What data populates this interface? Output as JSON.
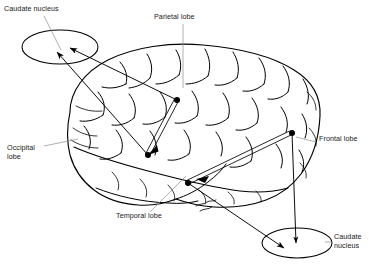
{
  "figure": {
    "background_color": "#ffffff",
    "ink_color": "#000000",
    "leader_color": "#8d8d8d",
    "width": 369,
    "height": 273
  },
  "labels": {
    "caudate_nucleus_top": "Caudate nucleus",
    "parietal_lobe": "Parietal lobe",
    "frontal_lobe": "Frontal lobe",
    "occipital_lobe_line1": "Occipital",
    "occipital_lobe_line2": "lobe",
    "temporal_lobe": "Temporal lobe",
    "caudate_nucleus_bottom_line1": "Caudate",
    "caudate_nucleus_bottom_line2": "nucleus"
  },
  "structures": {
    "ellipses": [
      {
        "name": "caudate-nucleus-upper-left",
        "center_x": 60,
        "center_y": 47,
        "radius_x": 38,
        "radius_y": 17,
        "incoming_arrows": 2
      },
      {
        "name": "caudate-nucleus-lower-right",
        "center_x": 297,
        "center_y": 243,
        "radius_x": 35,
        "radius_y": 15,
        "incoming_arrows": 2
      }
    ],
    "cortical_nodes": [
      {
        "name": "parietal-node",
        "x": 177,
        "y": 100
      },
      {
        "name": "occipital-node",
        "x": 148,
        "y": 155
      },
      {
        "name": "temporal-node",
        "x": 188,
        "y": 183
      },
      {
        "name": "frontal-node",
        "x": 292,
        "y": 133
      }
    ],
    "connections": [
      {
        "name": "parietal-to-occipital-tract",
        "from": "parietal-node",
        "to": "occipital-node",
        "style": "double-line"
      },
      {
        "name": "frontal-to-temporal-tract",
        "from": "frontal-node",
        "to": "temporal-node",
        "style": "double-line"
      },
      {
        "name": "parietal-to-upper-caudate-arrow",
        "from": "parietal-node",
        "to": "caudate-nucleus-upper-left",
        "style": "arrow"
      },
      {
        "name": "occipital-to-upper-caudate-arrow",
        "from": "occipital-node",
        "to": "caudate-nucleus-upper-left",
        "style": "arrow"
      },
      {
        "name": "temporal-to-lower-caudate-arrow",
        "from": "temporal-node",
        "to": "caudate-nucleus-lower-right",
        "style": "arrow"
      },
      {
        "name": "frontal-to-lower-caudate-arrow",
        "from": "frontal-node",
        "to": "caudate-nucleus-lower-right",
        "style": "arrow"
      }
    ]
  }
}
